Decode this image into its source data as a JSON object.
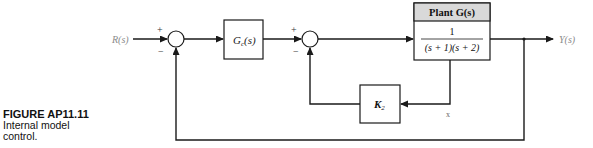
{
  "caption": {
    "figure_label": "FIGURE AP11.11",
    "line1": "Internal model",
    "line2": "control."
  },
  "diagram": {
    "input_label": "R(s)",
    "output_label": "Y(s)",
    "junction1": {
      "top_sign": "+",
      "bottom_sign": "−"
    },
    "junction2": {
      "top_sign": "+",
      "bottom_sign": "−"
    },
    "controller": {
      "label_main": "G",
      "label_sub": "c",
      "label_arg": "(s)"
    },
    "plant": {
      "header": "Plant G(s)",
      "numerator": "1",
      "denominator": "(s + 1)(s + 2)",
      "header_color": "#d9d9d9"
    },
    "feedback_gain": {
      "label_main": "K",
      "label_sub": "2"
    },
    "state_label": "x",
    "colors": {
      "line": "#1a1a1a",
      "label_gray": "#8a8a8a"
    }
  }
}
